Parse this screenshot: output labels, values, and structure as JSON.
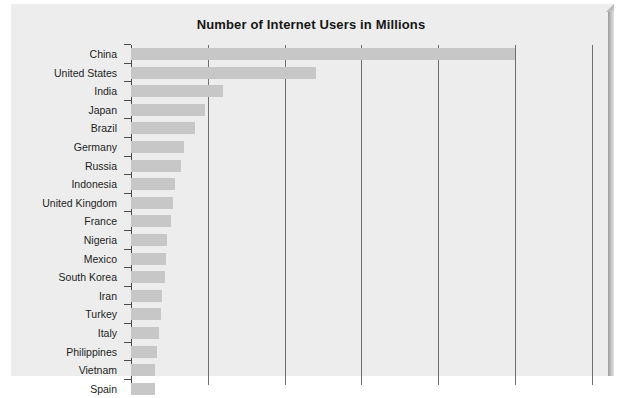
{
  "chart_data": {
    "type": "bar",
    "orientation": "horizontal",
    "title": "Number of Internet Users in Millions",
    "xlabel": "",
    "ylabel": "",
    "categories": [
      "China",
      "United States",
      "India",
      "Japan",
      "Brazil",
      "Germany",
      "Russia",
      "Indonesia",
      "United Kingdom",
      "France",
      "Nigeria",
      "Mexico",
      "South Korea",
      "Iran",
      "Turkey",
      "Italy",
      "Philippines",
      "Vietnam",
      "Spain"
    ],
    "values": [
      800,
      385,
      192,
      155,
      134,
      111,
      105,
      91,
      87,
      84,
      75,
      73,
      70,
      65,
      62,
      58,
      54,
      51,
      49
    ],
    "xlim": [
      0,
      1000
    ],
    "xticks": [
      0,
      160,
      320,
      480,
      640,
      800,
      960
    ],
    "grid": true,
    "legend": false,
    "bar_color": "#c7c7c7",
    "axis_color": "#4a4a4a",
    "gridline_color": "#6e6e6e",
    "background_color": "#ededed",
    "note": "Chart is cropped at the bottom; the Spain row is only partially visible."
  },
  "page": {
    "background_color": "#ffffff",
    "card_background": "#ededed"
  }
}
